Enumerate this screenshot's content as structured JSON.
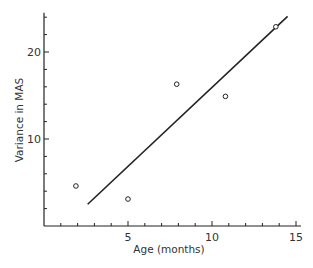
{
  "chart_data": {
    "type": "scatter",
    "title": "",
    "xlabel": "Age (months)",
    "ylabel": "Variance in MAS",
    "xlim": [
      0,
      15.3
    ],
    "ylim": [
      0,
      24.5
    ],
    "grid": false,
    "legend": null,
    "x_ticks": [
      5,
      10,
      15
    ],
    "x_minor_tick_step": 1,
    "y_ticks": [
      10,
      20
    ],
    "y_minor_tick_step": 2,
    "points": [
      {
        "x": 1.9,
        "y": 4.6
      },
      {
        "x": 5.0,
        "y": 3.1
      },
      {
        "x": 7.9,
        "y": 16.3
      },
      {
        "x": 10.8,
        "y": 14.9
      },
      {
        "x": 13.8,
        "y": 22.9
      }
    ],
    "regression_line": {
      "x1": 2.6,
      "y1": 2.5,
      "x2": 14.5,
      "y2": 24.1
    },
    "marker": "open-circle",
    "colors": {
      "ink": "#222222",
      "background": "#ffffff"
    }
  },
  "labels": {
    "xlabel": "Age (months)",
    "ylabel": "Variance in MAS"
  }
}
